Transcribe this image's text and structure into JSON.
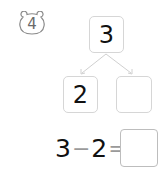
{
  "problem": {
    "number": "4",
    "badge_icon": "bear-face-badge-icon"
  },
  "number_bond": {
    "whole": "3",
    "part_left": "2",
    "part_right": ""
  },
  "equation": {
    "left": "3",
    "operator": "−",
    "right": "2",
    "equals": "=",
    "answer": ""
  },
  "colors": {
    "box_border": "#d6d6d6",
    "answer_border": "#bdbdbd",
    "arrow": "#d0d0d0",
    "text": "#111111",
    "badge": "#6b6b6b"
  }
}
